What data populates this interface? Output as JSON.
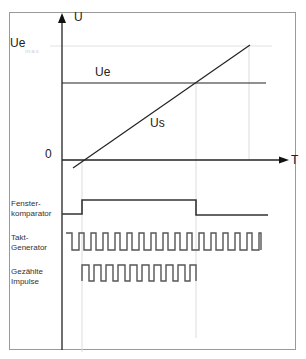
{
  "diagram": {
    "type": "timing-diagram",
    "upper_plot": {
      "y_axis_label": "U",
      "x_axis_label": "T",
      "origin_label": "0",
      "ue_max_label": "Ue",
      "ue_max_subscript": "max",
      "curves": [
        {
          "name": "Ue",
          "label": "Ue",
          "kind": "constant"
        },
        {
          "name": "Us",
          "label": "Us",
          "kind": "ramp"
        }
      ]
    },
    "signals": [
      {
        "label_line1": "Fenster-",
        "label_line2": "komparator",
        "kind": "window-pulse"
      },
      {
        "label_line1": "Takt-",
        "label_line2": "Generator",
        "kind": "clock"
      },
      {
        "label_line1": "Gezählte",
        "label_line2": "Impulse",
        "kind": "gated-clock"
      }
    ],
    "colors": {
      "line": "#222222",
      "signal": "#555555",
      "guide": "#d8d8d8",
      "frame": "#9a9a9a"
    }
  }
}
